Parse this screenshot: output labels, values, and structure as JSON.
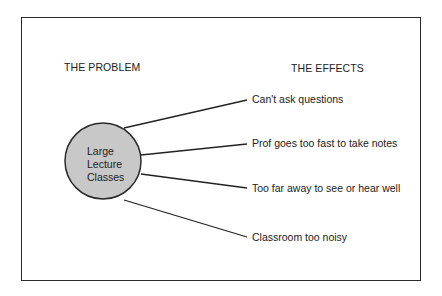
{
  "headings": {
    "problem": "THE PROBLEM",
    "effects": "THE EFFECTS"
  },
  "problem": {
    "lines": [
      "Large",
      "Lecture",
      "Classes"
    ],
    "fill_color": "#c8c8c8"
  },
  "effects": [
    {
      "label": "Can't ask questions"
    },
    {
      "label": "Prof goes too fast to take notes"
    },
    {
      "label": "Too far away to see or hear well"
    },
    {
      "label": "Classroom too noisy"
    }
  ]
}
